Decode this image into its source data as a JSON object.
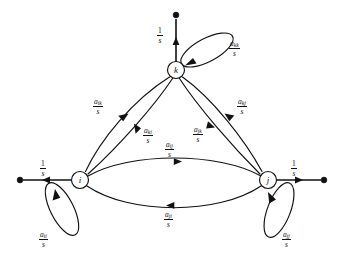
{
  "figure": {
    "type": "signal-flow-graph",
    "background_color": "#ffffff",
    "stroke_color": "#111111"
  },
  "nodes": [
    {
      "id": "i",
      "label": "i",
      "cx": 80,
      "cy": 180,
      "r": 8.5
    },
    {
      "id": "j",
      "label": "j",
      "cx": 268,
      "cy": 180,
      "r": 8.5
    },
    {
      "id": "k",
      "label": "k",
      "cx": 176,
      "cy": 70,
      "r": 8.5
    }
  ],
  "terminals": [
    {
      "id": "terminal-i",
      "cx": 20,
      "cy": 180,
      "r": 2.8
    },
    {
      "id": "terminal-j",
      "cx": 324,
      "cy": 180,
      "r": 2.8
    },
    {
      "id": "terminal-k",
      "cx": 176,
      "cy": 15,
      "r": 2.8
    }
  ],
  "io_branches": [
    {
      "id": "io-i",
      "from": "i",
      "to": "terminal-i",
      "direction": "left",
      "gain_numerator": "1",
      "gain_denominator": "s"
    },
    {
      "id": "io-j",
      "from": "j",
      "to": "terminal-j",
      "direction": "right",
      "gain_numerator": "1",
      "gain_denominator": "s"
    },
    {
      "id": "io-k",
      "from": "k",
      "to": "terminal-k",
      "direction": "up",
      "gain_numerator": "1",
      "gain_denominator": "s"
    }
  ],
  "self_loops": [
    {
      "id": "loop-ii",
      "node": "i",
      "gain_base": "a",
      "gain_subscript": "ii",
      "gain_denominator": "s"
    },
    {
      "id": "loop-jj",
      "node": "j",
      "gain_base": "a",
      "gain_subscript": "jj",
      "gain_denominator": "s"
    },
    {
      "id": "loop-kk",
      "node": "k",
      "gain_base": "a",
      "gain_subscript": "kk",
      "gain_denominator": "s"
    }
  ],
  "branches": [
    {
      "id": "branch-ik",
      "from": "i",
      "to": "k",
      "gain_base": "a",
      "gain_subscript": "ik",
      "gain_denominator": "s"
    },
    {
      "id": "branch-ki",
      "from": "k",
      "to": "i",
      "gain_base": "a",
      "gain_subscript": "ki",
      "gain_denominator": "s"
    },
    {
      "id": "branch-kj",
      "from": "k",
      "to": "j",
      "gain_base": "a",
      "gain_subscript": "kj",
      "gain_denominator": "s"
    },
    {
      "id": "branch-jk",
      "from": "j",
      "to": "k",
      "gain_base": "a",
      "gain_subscript": "jk",
      "gain_denominator": "s"
    },
    {
      "id": "branch-ij",
      "from": "i",
      "to": "j",
      "gain_base": "a",
      "gain_subscript": "ij",
      "gain_denominator": "s"
    },
    {
      "id": "branch-ji",
      "from": "j",
      "to": "i",
      "gain_base": "a",
      "gain_subscript": "ji",
      "gain_denominator": "s"
    }
  ],
  "labels": {
    "node_i": "i",
    "node_j": "j",
    "node_k": "k",
    "gain_one": "1",
    "gain_s": "s",
    "a": "a",
    "sub_ii": "ii",
    "sub_jj": "jj",
    "sub_kk": "kk",
    "sub_ik": "ik",
    "sub_ki": "ki",
    "sub_kj": "kj",
    "sub_jk": "jk",
    "sub_ij": "ij",
    "sub_ji": "ji"
  }
}
